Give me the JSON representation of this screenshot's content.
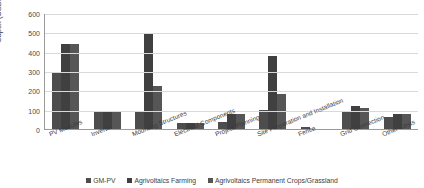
{
  "chart_data": {
    "type": "bar",
    "title": "",
    "xlabel": "",
    "ylabel": "Capex (USD/kWp)",
    "ylim": [
      0,
      600
    ],
    "yticks": [
      "0",
      "100",
      "200",
      "300",
      "400",
      "500",
      "600"
    ],
    "grid": true,
    "legend_position": "bottom",
    "categories": [
      "PV Modules",
      "Inverter",
      "Mounting Structures",
      "Electrical Components",
      "Project Planning",
      "Site Preparation and Installation",
      "Fence",
      "Grid Connection",
      "Other Costs"
    ],
    "series": [
      {
        "name": "GM-PV",
        "color": "#4d4d4d",
        "values": [
          295,
          90,
          90,
          30,
          35,
          100,
          10,
          95,
          60
        ]
      },
      {
        "name": "Agrivoltaics Farming",
        "color": "#404040",
        "values": [
          440,
          95,
          490,
          33,
          78,
          380,
          0,
          120,
          80
        ]
      },
      {
        "name": "Agrivoltaics Permanent Crops/Grassland",
        "color": "#565656",
        "values": [
          440,
          95,
          225,
          33,
          78,
          180,
          0,
          110,
          80
        ]
      }
    ]
  },
  "legend": {
    "items": [
      {
        "label": "GM-PV"
      },
      {
        "label": "Agrivoltaics Farming"
      },
      {
        "label": "Agrivoltaics Permanent Crops/Grassland"
      }
    ]
  }
}
